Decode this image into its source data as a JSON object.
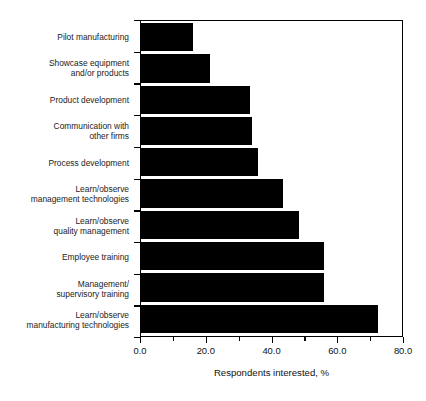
{
  "chart_data": {
    "type": "bar",
    "orientation": "horizontal",
    "title": "",
    "xlabel": "Respondents interested, %",
    "ylabel": "",
    "xlim": [
      0.0,
      80.0
    ],
    "xticks": [
      "0.0",
      "20.0",
      "40.0",
      "60.0",
      "80.0"
    ],
    "xtick_values": [
      0.0,
      20.0,
      40.0,
      60.0,
      80.0
    ],
    "minor_tick_values": [
      10.0,
      30.0,
      50.0,
      70.0
    ],
    "grid": false,
    "legend": null,
    "bar_color": "#000000",
    "categories": [
      "Pilot manufacturing",
      "Showcase equipment\nand/or products",
      "Product development",
      "Communication with\nother firms",
      "Process development",
      "Learn/observe\nmanagement technologies",
      "Learn/observe\nquality management",
      "Employee training",
      "Management/\nsupervisory training",
      "Learn/observe\nmanufacturing technologies"
    ],
    "values": [
      16.0,
      21.0,
      33.5,
      34.0,
      36.0,
      43.5,
      48.5,
      56.0,
      56.0,
      72.5
    ]
  },
  "axis": {
    "x_title": "Respondents interested, %"
  }
}
